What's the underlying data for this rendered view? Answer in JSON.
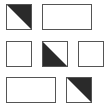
{
  "diagram": {
    "title": "",
    "colors": {
      "border": "#555555",
      "fill": "#2a2a2a",
      "background": "#ffffff"
    },
    "rows": [
      {
        "cells": [
          {
            "type": "square",
            "fill": "upper-right-triangle",
            "x": 6,
            "y": 4,
            "w": 26,
            "h": 26
          },
          {
            "type": "rectangle",
            "fill": "none",
            "x": 42,
            "y": 4,
            "w": 50,
            "h": 26
          }
        ]
      },
      {
        "cells": [
          {
            "type": "square",
            "fill": "none",
            "x": 6,
            "y": 41,
            "w": 26,
            "h": 26
          },
          {
            "type": "square",
            "fill": "lower-left-triangle",
            "x": 42,
            "y": 41,
            "w": 26,
            "h": 26
          },
          {
            "type": "square",
            "fill": "none",
            "x": 78,
            "y": 41,
            "w": 26,
            "h": 26
          }
        ]
      },
      {
        "cells": [
          {
            "type": "rectangle",
            "fill": "none",
            "x": 6,
            "y": 77,
            "w": 50,
            "h": 26
          },
          {
            "type": "square",
            "fill": "upper-right-triangle",
            "x": 66,
            "y": 77,
            "w": 26,
            "h": 26
          }
        ]
      }
    ]
  }
}
